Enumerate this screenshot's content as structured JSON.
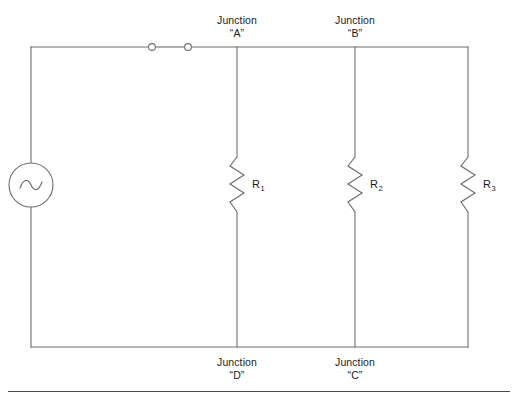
{
  "diagram": {
    "type": "electrical-schematic",
    "background_color": "#ffffff",
    "wire_color": "#6e6e73",
    "text_color": "#1a1a1a",
    "source": {
      "kind": "ac-voltage-source",
      "icon": "ac-source-icon",
      "symbol": "sine-in-circle"
    },
    "switch": {
      "kind": "switch",
      "icon": "switch-icon",
      "state": "closed",
      "terminal_count": 2
    },
    "junction_labels": [
      {
        "id": "A",
        "line1": "Junction",
        "line2": "“A”",
        "position": "top"
      },
      {
        "id": "B",
        "line1": "Junction",
        "line2": "“B”",
        "position": "top"
      },
      {
        "id": "C",
        "line1": "Junction",
        "line2": "“C”",
        "position": "bottom"
      },
      {
        "id": "D",
        "line1": "Junction",
        "line2": "“D”",
        "position": "bottom"
      }
    ],
    "resistors": [
      {
        "id": "R1",
        "letter": "R",
        "subscript": "1"
      },
      {
        "id": "R2",
        "letter": "R",
        "subscript": "2"
      },
      {
        "id": "R3",
        "letter": "R",
        "subscript": "3"
      }
    ],
    "caption": {
      "rule": true,
      "text": ""
    }
  }
}
